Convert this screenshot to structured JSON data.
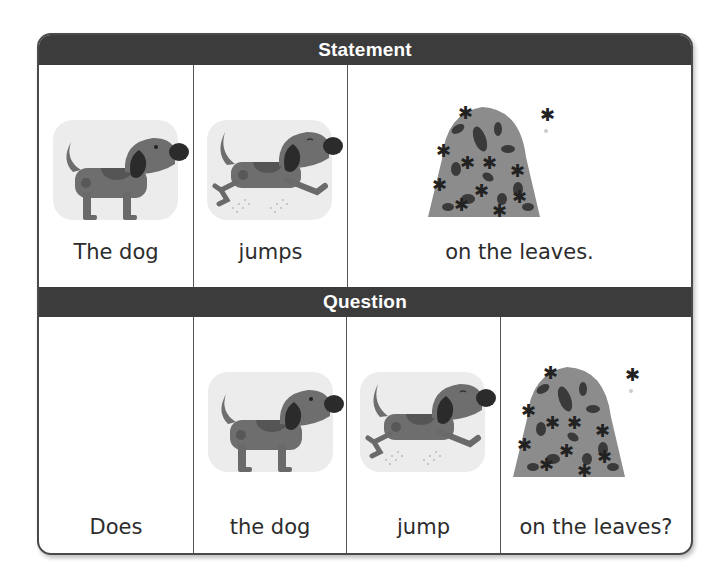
{
  "statement": {
    "header": "Statement",
    "cells": [
      {
        "label": "The dog",
        "image": "dog-standing"
      },
      {
        "label": "jumps",
        "image": "dog-jumping"
      },
      {
        "label": "on the leaves.",
        "image": "leaf-pile"
      }
    ]
  },
  "question": {
    "header": "Question",
    "cells": [
      {
        "label": "Does",
        "image": ""
      },
      {
        "label": "the dog",
        "image": "dog-standing"
      },
      {
        "label": "jump",
        "image": "dog-jumping"
      },
      {
        "label": "on the leaves?",
        "image": "leaf-pile"
      }
    ]
  },
  "colors": {
    "header_bg": "#3c3c3c",
    "header_text": "#ffffff",
    "border": "#4a4a4a",
    "dog_body": "#6e6e6e",
    "dog_ear": "#2b2b2b",
    "image_bg": "#ececec",
    "leaf_pile": "#8a8a8a"
  }
}
